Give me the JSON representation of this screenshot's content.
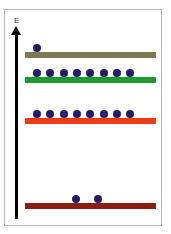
{
  "axis": {
    "label": "E",
    "direction": "up"
  },
  "colors": {
    "electron": "#231a6b",
    "axis": "#000000",
    "frame": "#b8b8b8"
  },
  "levels": [
    {
      "name": "level-top",
      "color": "#7d7a52",
      "y": 52,
      "electrons": [
        {
          "x": 33
        }
      ]
    },
    {
      "name": "level-green",
      "color": "#1f9a2e",
      "y": 77,
      "electrons": [
        {
          "x": 33
        },
        {
          "x": 46
        },
        {
          "x": 60
        },
        {
          "x": 73
        },
        {
          "x": 86
        },
        {
          "x": 100
        },
        {
          "x": 113
        },
        {
          "x": 126
        }
      ]
    },
    {
      "name": "level-orange",
      "color": "#f03a12",
      "y": 118,
      "electrons": [
        {
          "x": 33
        },
        {
          "x": 46
        },
        {
          "x": 60
        },
        {
          "x": 73
        },
        {
          "x": 86
        },
        {
          "x": 100
        },
        {
          "x": 113
        },
        {
          "x": 126
        }
      ]
    },
    {
      "name": "level-bottom",
      "color": "#8c1c0e",
      "y": 203,
      "electrons": [
        {
          "x": 72
        },
        {
          "x": 94
        }
      ]
    }
  ]
}
